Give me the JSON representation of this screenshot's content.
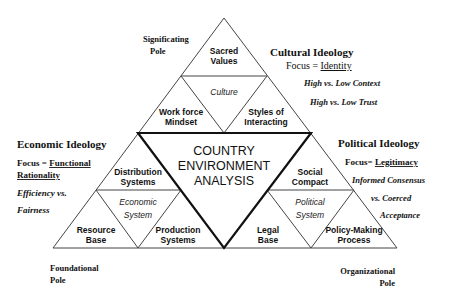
{
  "center": {
    "lines": [
      "COUNTRY",
      "ENVIRONMENT",
      "ANALYSIS"
    ]
  },
  "culture": {
    "system_label": "Culture",
    "top": [
      "Sacred",
      "Values"
    ],
    "left": [
      "Work force",
      "Mindset"
    ],
    "right": [
      "Styles of",
      "Interacting"
    ]
  },
  "economic": {
    "system_label": [
      "Economic",
      "System"
    ],
    "top": [
      "Distribution",
      "Systems"
    ],
    "left": [
      "Resource",
      "Base"
    ],
    "right": [
      "Production",
      "Systems"
    ]
  },
  "political": {
    "system_label": [
      "Political",
      "System"
    ],
    "top": [
      "Social",
      "Compact"
    ],
    "left": [
      "Legal",
      "Base"
    ],
    "right": [
      "Policy-Making",
      "Process"
    ]
  },
  "poles": {
    "signifying": [
      "Significating",
      "Pole"
    ],
    "foundational": [
      "Foundational",
      "Pole"
    ],
    "organizational": [
      "Organizational",
      "Pole"
    ]
  },
  "ideologies": {
    "cultural": {
      "title": "Cultural Ideology",
      "focus_prefix": "Focus = ",
      "focus_value": "Identity",
      "dimensions": [
        "High vs. Low Context",
        "High vs. Low Trust"
      ]
    },
    "economic": {
      "title": "Economic Ideology",
      "focus_prefix": "Focus = ",
      "focus_value_lines": [
        "Functional",
        "Rationality"
      ],
      "dimensions": [
        "Efficiency vs.",
        "Fairness"
      ]
    },
    "political": {
      "title": "Political Ideology",
      "focus_prefix": "Focus=  ",
      "focus_value": "Legitimacy",
      "dimensions": [
        "Informed Consensus",
        "vs. Coerced",
        "Acceptance"
      ]
    }
  }
}
